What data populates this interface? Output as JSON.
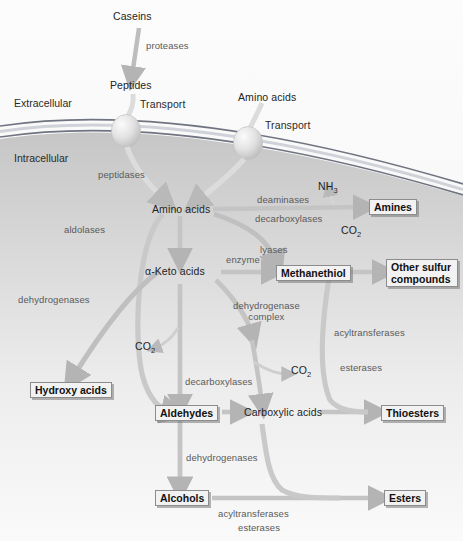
{
  "figure": {
    "compartments": {
      "outside": "Extracellular",
      "inside": "Intracellular"
    }
  },
  "substrates": {
    "caseins": "Caseins",
    "peptides": "Peptides",
    "amino_acids_out": "Amino acids",
    "amino_acids_in": "Amino acids",
    "keto_acids": "α-Keto acids",
    "carboxylic_acids": "Carboxylic acids",
    "nh3": "NH",
    "nh3_sub": "3",
    "co2": "CO",
    "co2_sub": "2"
  },
  "products": {
    "amines": "Amines",
    "methanethiol": "Methanethiol",
    "other_sulfur_1": "Other sulfur",
    "other_sulfur_2": "compounds",
    "hydroxy_acids": "Hydroxy acids",
    "aldehydes": "Aldehydes",
    "thioesters": "Thioesters",
    "alcohols": "Alcohols",
    "esters": "Esters"
  },
  "enzymes": {
    "proteases": "proteases",
    "transport_1": "Transport",
    "transport_2": "Transport",
    "peptidases": "peptidases",
    "deaminases": "deaminases",
    "decarboxylases_top": "decarboxylases",
    "lyases": "lyases",
    "enzyme": "enzyme",
    "aldolases": "aldolases",
    "dehydrogenases_left": "dehydrogenases",
    "dehydrogenase_complex_1": "dehydrogenase",
    "dehydrogenase_complex_2": "complex",
    "decarboxylases_bottom": "decarboxylases",
    "acyltransferases_right": "acyltransferases",
    "esterases_right": "esterases",
    "dehydrogenases_bottom": "dehydrogenases",
    "acyltransferases_bottom": "acyltransferases",
    "esterases_bottom": "esterases"
  },
  "colors": {
    "arrow": "#b9b9b9",
    "arrow_dark": "#aaaaaa",
    "membrane": "#6f7480",
    "label": "#232323",
    "enzyme_label": "#5a5a5a",
    "box_fill": "#f2f2f2",
    "box_border": "#8c8c8c"
  }
}
